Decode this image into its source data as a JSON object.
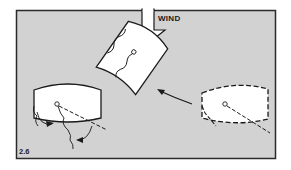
{
  "figure": {
    "number": "2.6",
    "wind_label": "WIND",
    "colors": {
      "panel_background": "#d2d2d2",
      "frame": "#2a2a2a",
      "sail_fill": "#ffffff",
      "line": "#1a1a1a"
    },
    "elements": [
      {
        "id": "wind-arrow",
        "description": "Hollow arrow pointing down indicating wind direction"
      },
      {
        "id": "sail-left",
        "description": "Sail shape with solid outline, with curved arrows showing rotation"
      },
      {
        "id": "sail-center",
        "description": "Sail shape rotated, solid outline, with wavy luff lines"
      },
      {
        "id": "sail-right",
        "description": "Sail shape with dashed outline (initial position)"
      },
      {
        "id": "motion-arrow",
        "description": "Curved arrow from right sail to center sail"
      }
    ]
  }
}
